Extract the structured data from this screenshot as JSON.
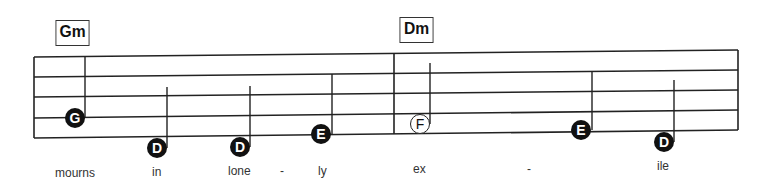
{
  "chords": [
    {
      "label": "Gm",
      "x": 54,
      "y": 20,
      "w": 35,
      "h": 24
    },
    {
      "label": "Dm",
      "x": 398,
      "y": 17,
      "w": 35,
      "h": 24
    }
  ],
  "staff": {
    "left": 34,
    "right": 738,
    "lines_left_y": [
      57,
      77,
      97,
      118,
      138
    ],
    "lines_right_y": [
      50,
      70,
      90,
      110,
      130
    ],
    "barline_x": 394,
    "color": "#222222"
  },
  "notes": [
    {
      "name": "G",
      "style": "filled",
      "cx": 75,
      "cy": 118,
      "stem_x": 85,
      "stem_top": 56
    },
    {
      "name": "D",
      "style": "filled",
      "cx": 157,
      "cy": 148,
      "stem_x": 167,
      "stem_top": 87
    },
    {
      "name": "D",
      "style": "filled",
      "cx": 240,
      "cy": 147,
      "stem_x": 250,
      "stem_top": 86
    },
    {
      "name": "E",
      "style": "filled",
      "cx": 321,
      "cy": 134,
      "stem_x": 332,
      "stem_top": 74
    },
    {
      "name": "F",
      "style": "hollow",
      "cx": 420,
      "cy": 124,
      "stem_x": 430,
      "stem_top": 63
    },
    {
      "name": "E",
      "style": "filled",
      "cx": 581,
      "cy": 130,
      "stem_x": 592,
      "stem_top": 71
    },
    {
      "name": "D",
      "style": "filled",
      "cx": 664,
      "cy": 142,
      "stem_x": 674,
      "stem_top": 80
    }
  ],
  "lyrics": [
    {
      "text": "mourns",
      "x": 55,
      "y": 166
    },
    {
      "text": "in",
      "x": 152,
      "y": 165
    },
    {
      "text": "lone",
      "x": 228,
      "y": 164
    },
    {
      "text": "-",
      "x": 280,
      "y": 164
    },
    {
      "text": "ly",
      "x": 318,
      "y": 164
    },
    {
      "text": "ex",
      "x": 413,
      "y": 162
    },
    {
      "text": "-",
      "x": 527,
      "y": 162
    },
    {
      "text": "ile",
      "x": 657,
      "y": 159
    }
  ]
}
